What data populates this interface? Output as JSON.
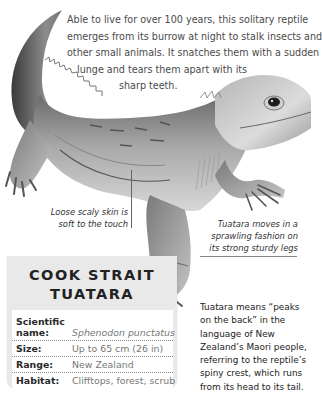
{
  "intro": {
    "lines": [
      "Able to live for over 100 years, this solitary reptile",
      "emerges from its burrow at night to stalk insects and",
      "other small animals. It snatches them with a sudden",
      "lunge and tears them apart with its",
      "sharp teeth."
    ]
  },
  "captions": {
    "skin": [
      "Loose scaly skin is",
      "soft to the touch"
    ],
    "legs": [
      "Tuatara moves in a",
      "sprawling fashion on",
      "its strong sturdy legs"
    ]
  },
  "factbox": {
    "title": [
      "COOK STRAIT",
      "TUATARA"
    ],
    "rows": [
      {
        "label": [
          "Scientific",
          "name:"
        ],
        "value": "Sphenodon punctatus",
        "italic": true
      },
      {
        "label": [
          "Size:"
        ],
        "value": "Up to 65 cm (26 in)",
        "italic": false
      },
      {
        "label": [
          "Range:"
        ],
        "value": "New Zealand",
        "italic": false
      },
      {
        "label": [
          "Habitat:"
        ],
        "value": "Clifftops, forest, scrub",
        "italic": false
      }
    ]
  },
  "sidenote": {
    "lines": [
      "Tuatara means “peaks",
      "on the back” in the",
      "language of New",
      "Zealand’s Maori people,",
      "referring to the reptile’s",
      "spiny crest, which runs",
      "from its head to its tail."
    ]
  },
  "illustration": {
    "subject": "tuatara-lizard-drawing",
    "palette": {
      "dark": "#3c3c3c",
      "mid": "#8a8a8a",
      "light": "#c8c8c8",
      "highlight": "#e6e6e6",
      "factbox_bg": "#e9e9e9"
    }
  }
}
